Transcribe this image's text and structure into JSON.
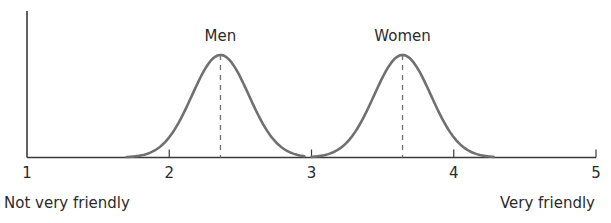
{
  "chart_data": {
    "type": "line",
    "title": "",
    "xlabel": "",
    "ylabel": "",
    "xlim": [
      1,
      5
    ],
    "x_ticks": [
      "1",
      "2",
      "3",
      "4",
      "5"
    ],
    "x_end_labels": {
      "left": "Not very friendly",
      "right": "Very friendly"
    },
    "grid": false,
    "legend": "none",
    "annotations": [
      "Men",
      "Women",
      "dashed vertical lines mark each distribution's mean"
    ],
    "series": [
      {
        "name": "Men",
        "distribution": "normal",
        "mean": 2.36,
        "sd": 0.2,
        "x_range": [
          1.7,
          2.95
        ],
        "relative_peak_height": 1.0
      },
      {
        "name": "Women",
        "distribution": "normal",
        "mean": 3.64,
        "sd": 0.2,
        "x_range": [
          3.0,
          4.28
        ],
        "relative_peak_height": 1.0
      }
    ],
    "colors": {
      "curve": "#707070",
      "axis": "#3a3a3a",
      "text": "#2b2b2b"
    }
  }
}
